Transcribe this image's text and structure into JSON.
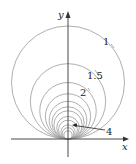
{
  "figure": {
    "type": "family-of-circles",
    "axes": {
      "x_label": "x",
      "y_label": "y"
    },
    "colors": {
      "circle": "#9a9a9a",
      "axis": "#333333",
      "label": "#222222"
    },
    "circle_parameters": [
      1,
      1.5,
      2,
      2.5,
      3,
      3.5,
      4,
      5,
      6,
      8,
      10,
      14
    ],
    "labels": [
      {
        "text": "1",
        "param": 1
      },
      {
        "text": "1.5",
        "param": 1.5
      },
      {
        "text": "2",
        "param": 2
      },
      {
        "text": "4",
        "param": 4
      }
    ]
  }
}
